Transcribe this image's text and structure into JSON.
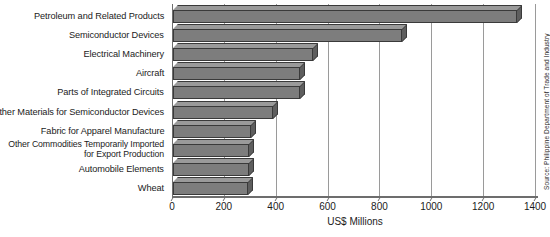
{
  "chart_data": {
    "type": "bar",
    "orientation": "horizontal",
    "title": "",
    "xlabel": "US$ Millions",
    "ylabel": "",
    "xlim": [
      0,
      1400
    ],
    "xticks": [
      0,
      200,
      400,
      600,
      800,
      1000,
      1200,
      1400
    ],
    "xtick_labels": [
      "0",
      "200",
      "400",
      "600",
      "800",
      "1000",
      "1200",
      "1400"
    ],
    "grid": true,
    "grid_axis": "x",
    "legend": false,
    "categories": [
      "Petroleum and Related Products",
      "Semiconductor Devices",
      "Electrical Machinery",
      "Aircraft",
      "Parts of Integrated Circuits",
      "Other Materials for Semiconductor Devices",
      "Fabric for Apparel Manufacture",
      "Other Commodities Temporarily Imported for Export Production",
      "Automobile Elements",
      "Wheat"
    ],
    "values": [
      1325,
      885,
      540,
      490,
      490,
      385,
      300,
      295,
      292,
      290
    ],
    "bar_color": "#7d7d7d",
    "bar_edge_color": "#3a3a3a",
    "bar_top_color": "#9a9a9a",
    "bar_side_color": "#5e5e5e",
    "axis_color": "#6d6d6d",
    "grid_color": "#9a9a9a",
    "annotations": [
      "Source: Philippine Department of Trade and Industry"
    ]
  },
  "source_note": "Source: Philippine Department of Trade and Industry"
}
